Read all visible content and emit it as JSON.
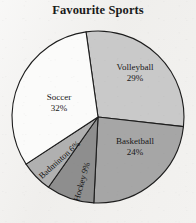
{
  "chart_data": {
    "type": "pie",
    "title": "Favourite Sports",
    "categories": [
      "Volleyball",
      "Basketball",
      "Hockey",
      "Badminton",
      "Soccer"
    ],
    "values": [
      29,
      24,
      9,
      6,
      32
    ],
    "unit": "%",
    "legend": "none",
    "labels_inside": true,
    "slices": [
      {
        "name": "Volleyball",
        "value": 29,
        "label": "Volleyball",
        "pct": "29%",
        "color": "#c9c9c9",
        "start_deg": -8,
        "end_deg": 96.4
      },
      {
        "name": "Basketball",
        "value": 24,
        "label": "Basketball",
        "pct": "24%",
        "color": "#a6a6a6",
        "start_deg": 96.4,
        "end_deg": 182.8
      },
      {
        "name": "Hockey",
        "value": 9,
        "label": "Hockey",
        "pct": "9%",
        "color": "#8e8e8e",
        "start_deg": 182.8,
        "end_deg": 215.2
      },
      {
        "name": "Badminton",
        "value": 6,
        "label": "Badminton",
        "pct": "6%",
        "color": "#b0b0b0",
        "start_deg": 215.2,
        "end_deg": 236.8
      },
      {
        "name": "Soccer",
        "value": 32,
        "label": "Soccer",
        "pct": "32%",
        "color": "#fbfbfa",
        "start_deg": 236.8,
        "end_deg": 352
      }
    ],
    "geometry": {
      "cx": 98,
      "cy": 117,
      "r": 86
    },
    "stroke_color": "#1d1d1d",
    "background": "#f0efed"
  },
  "labels": {
    "volleyball": {
      "name": "Volleyball",
      "pct": "29%"
    },
    "basketball": {
      "name": "Basketball",
      "pct": "24%"
    },
    "soccer": {
      "name": "Soccer",
      "pct": "32%"
    },
    "badminton": {
      "text": "Badminton 6%"
    },
    "hockey": {
      "text": "Hockey 9%"
    }
  }
}
